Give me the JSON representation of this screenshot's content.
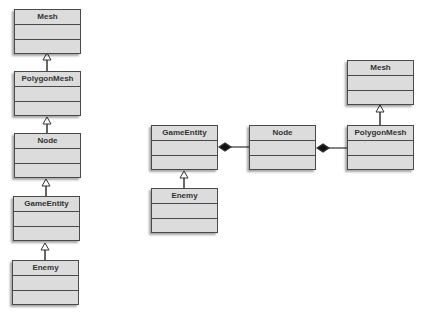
{
  "diagram": {
    "type": "uml-class-diagram",
    "colors": {
      "box_fill": "#dcdcdc",
      "box_border": "#4a4a4a",
      "text": "#333333",
      "line": "#333333"
    },
    "left_hierarchy": {
      "classes": [
        {
          "id": "mesh_l",
          "name": "Mesh"
        },
        {
          "id": "polygonmesh_l",
          "name": "PolygonMesh"
        },
        {
          "id": "node_l",
          "name": "Node"
        },
        {
          "id": "gameentity_l",
          "name": "GameEntity"
        },
        {
          "id": "enemy_l",
          "name": "Enemy"
        }
      ],
      "relations": [
        {
          "from": "PolygonMesh",
          "to": "Mesh",
          "kind": "generalization"
        },
        {
          "from": "Node",
          "to": "PolygonMesh",
          "kind": "generalization"
        },
        {
          "from": "GameEntity",
          "to": "Node",
          "kind": "generalization"
        },
        {
          "from": "Enemy",
          "to": "GameEntity",
          "kind": "generalization"
        }
      ]
    },
    "right_composition": {
      "classes": [
        {
          "id": "gameentity_r",
          "name": "GameEntity"
        },
        {
          "id": "enemy_r",
          "name": "Enemy"
        },
        {
          "id": "node_r",
          "name": "Node"
        },
        {
          "id": "polygonmesh_r",
          "name": "PolygonMesh"
        },
        {
          "id": "mesh_r",
          "name": "Mesh"
        }
      ],
      "relations": [
        {
          "from": "Enemy",
          "to": "GameEntity",
          "kind": "generalization"
        },
        {
          "from": "GameEntity",
          "to": "Node",
          "kind": "composition"
        },
        {
          "from": "Node",
          "to": "PolygonMesh",
          "kind": "composition"
        },
        {
          "from": "PolygonMesh",
          "to": "Mesh",
          "kind": "generalization"
        }
      ]
    }
  }
}
